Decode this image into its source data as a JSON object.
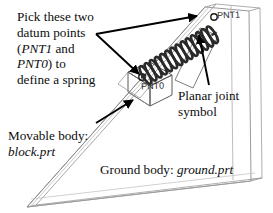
{
  "figure": {
    "background_color": "#ffffff",
    "line_color_geometry": "#8c8c8c",
    "line_color_annotation": "#000000",
    "spring_color": "#262626"
  },
  "callouts": {
    "pick_points": {
      "lines": [
        {
          "text": "Pick these two"
        },
        {
          "text": "datum points"
        },
        {
          "prefix": "(",
          "italic": "PNT1",
          "suffix": " and"
        },
        {
          "italic": "PNT0",
          "suffix": ") to"
        },
        {
          "text": "define a spring"
        }
      ]
    },
    "planar_joint": {
      "lines": [
        "Planar joint",
        "symbol"
      ]
    },
    "movable_body": {
      "label": "Movable body:",
      "part": "block.prt"
    },
    "ground_body": {
      "label": "Ground body: ",
      "part": "ground.prt"
    }
  },
  "datum_points": [
    {
      "name": "PNT1",
      "location": "top of incline"
    },
    {
      "name": "PNT0",
      "location": "on movable block"
    }
  ],
  "arrows": [
    {
      "name": "arrow-to-pnt1",
      "from": [
        96,
        34
      ],
      "to": [
        196,
        16
      ]
    },
    {
      "name": "arrow-to-pnt0",
      "from": [
        96,
        34
      ],
      "to": [
        146,
        79
      ]
    },
    {
      "name": "arrow-to-block",
      "from": [
        98,
        122
      ],
      "to": [
        135,
        99
      ]
    },
    {
      "name": "arrow-to-planar-joint",
      "from": [
        208,
        84
      ],
      "to": [
        199,
        34
      ]
    }
  ]
}
